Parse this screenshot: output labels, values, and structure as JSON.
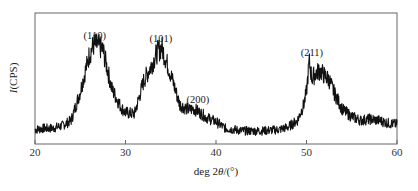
{
  "chart_data": {
    "type": "line",
    "title": "",
    "xlabel": "deg 2θ/(°)",
    "xlabel_parts": {
      "prefix": "deg 2",
      "theta": "θ",
      "suffix": "/(°)"
    },
    "ylabel": "I(CPS)",
    "ylabel_parts": {
      "italic": "I",
      "rest": "(CPS)"
    },
    "xlim": [
      20,
      60
    ],
    "ylim": [
      0,
      100
    ],
    "x_ticks": [
      20,
      30,
      40,
      50,
      60
    ],
    "y_ticks": [],
    "grid": false,
    "legend": null,
    "series": [
      {
        "name": "XRD pattern",
        "color": "#111111",
        "x": [
          20,
          21,
          22,
          23,
          24,
          25,
          26,
          26.5,
          27,
          27.5,
          28.5,
          29.5,
          30,
          31,
          32,
          33,
          33.5,
          34,
          35,
          36,
          37,
          37.5,
          38,
          39,
          40,
          41,
          43,
          45,
          47,
          48,
          49,
          49.7,
          50,
          50.3,
          50.6,
          51,
          51.5,
          52,
          52.5,
          53,
          54,
          55,
          56,
          57,
          58,
          59,
          60
        ],
        "y": [
          11,
          12,
          12,
          14,
          18,
          40,
          68,
          76,
          75,
          72,
          42,
          28,
          24,
          23,
          48,
          62,
          70,
          74,
          53,
          30,
          26,
          27,
          25,
          20,
          17,
          12,
          10,
          10,
          11,
          13,
          18,
          30,
          40,
          63,
          50,
          54,
          56,
          52,
          49,
          40,
          26,
          21,
          18,
          19,
          18,
          16,
          15
        ]
      }
    ],
    "annotations": [
      {
        "text": "(110)",
        "x": 26.6,
        "y": 80
      },
      {
        "text": "(101)",
        "x": 33.9,
        "y": 78
      },
      {
        "text": "(200)",
        "x": 38.0,
        "y": 31
      },
      {
        "text": "(211)",
        "x": 50.6,
        "y": 67
      }
    ]
  }
}
